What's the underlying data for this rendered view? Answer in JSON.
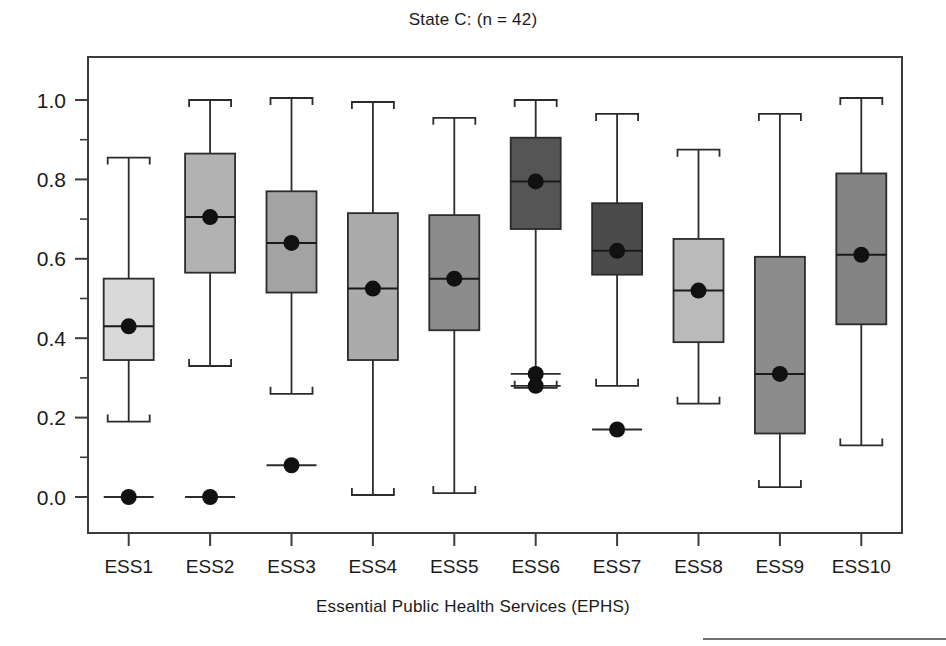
{
  "chart_data": {
    "type": "box",
    "title": "State C: (n = 42)",
    "xlabel": "Essential Public Health Services (EPHS)",
    "ylabel": "",
    "ylim": [
      -0.06,
      1.06
    ],
    "ytick_labels": [
      "0.0",
      "0.2",
      "0.4",
      "0.6",
      "0.8",
      "1.0"
    ],
    "ytick_values": [
      0.0,
      0.2,
      0.4,
      0.6,
      0.8,
      1.0
    ],
    "yminor_values": [
      0.1,
      0.3,
      0.5,
      0.7,
      0.9
    ],
    "grid": false,
    "legend": "none",
    "categories": [
      "ESS1",
      "ESS2",
      "ESS3",
      "ESS4",
      "ESS5",
      "ESS6",
      "ESS7",
      "ESS8",
      "ESS9",
      "ESS10"
    ],
    "boxes": [
      {
        "category": "ESS1",
        "whisker_low": 0.19,
        "q1": 0.345,
        "median": 0.43,
        "q3": 0.55,
        "whisker_high": 0.855,
        "mean": 0.43,
        "outliers": [
          0.0
        ],
        "fill": "#d9d9d9"
      },
      {
        "category": "ESS2",
        "whisker_low": 0.33,
        "q1": 0.565,
        "median": 0.705,
        "q3": 0.865,
        "whisker_high": 1.0,
        "mean": 0.705,
        "outliers": [
          0.0
        ],
        "fill": "#b2b2b2"
      },
      {
        "category": "ESS3",
        "whisker_low": 0.26,
        "q1": 0.515,
        "median": 0.64,
        "q3": 0.77,
        "whisker_high": 1.005,
        "mean": 0.64,
        "outliers": [
          0.08
        ],
        "fill": "#a3a3a3"
      },
      {
        "category": "ESS4",
        "whisker_low": 0.005,
        "q1": 0.345,
        "median": 0.525,
        "q3": 0.715,
        "whisker_high": 0.995,
        "mean": 0.525,
        "outliers": [],
        "fill": "#ababab"
      },
      {
        "category": "ESS5",
        "whisker_low": 0.01,
        "q1": 0.42,
        "median": 0.55,
        "q3": 0.71,
        "whisker_high": 0.955,
        "mean": 0.55,
        "outliers": [],
        "fill": "#8c8c8c"
      },
      {
        "category": "ESS6",
        "whisker_low": 0.275,
        "q1": 0.675,
        "median": 0.795,
        "q3": 0.905,
        "whisker_high": 1.0,
        "mean": 0.795,
        "outliers": [
          0.31,
          0.28
        ],
        "fill": "#555555"
      },
      {
        "category": "ESS7",
        "whisker_low": 0.28,
        "q1": 0.56,
        "median": 0.62,
        "q3": 0.74,
        "whisker_high": 0.965,
        "mean": 0.62,
        "outliers": [
          0.17
        ],
        "fill": "#4b4b4b"
      },
      {
        "category": "ESS8",
        "whisker_low": 0.235,
        "q1": 0.39,
        "median": 0.52,
        "q3": 0.65,
        "whisker_high": 0.875,
        "mean": 0.52,
        "outliers": [],
        "fill": "#bababa"
      },
      {
        "category": "ESS9",
        "whisker_low": 0.025,
        "q1": 0.16,
        "median": 0.31,
        "q3": 0.605,
        "whisker_high": 0.965,
        "mean": 0.31,
        "outliers": [],
        "fill": "#8c8c8c"
      },
      {
        "category": "ESS10",
        "whisker_low": 0.13,
        "q1": 0.435,
        "median": 0.61,
        "q3": 0.815,
        "whisker_high": 1.005,
        "mean": 0.61,
        "outliers": [],
        "fill": "#848484"
      }
    ]
  }
}
